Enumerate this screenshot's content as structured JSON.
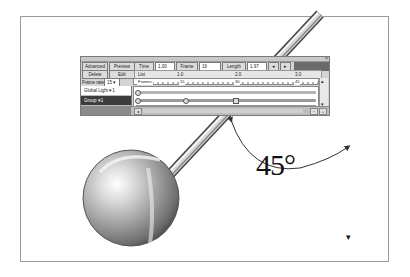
{
  "canvas": {
    "background": "#ffffff",
    "frame_border_color": "#9a9a9a"
  },
  "timeline_window": {
    "close_glyph": "×",
    "buttons_row1": [
      {
        "label": "Advanced"
      },
      {
        "label": "Preview"
      }
    ],
    "buttons_row2": [
      {
        "label": "Delete"
      },
      {
        "label": "Edit"
      }
    ],
    "time_label": "Time",
    "time_value": "1.00",
    "frame_label": "Frame",
    "frame_value": "16",
    "length_label": "Length",
    "length_value": "1.97",
    "nav_prev": "◂",
    "nav_next": "▸",
    "list_label": "List",
    "ruler_top_marks": [
      "1.0",
      "2.0",
      "3.0"
    ],
    "frame_rate_label": "Frame rate",
    "frame_rate_value": "15",
    "ruler_marks": [
      "Frames",
      "15",
      "30",
      "45"
    ],
    "layers": [
      {
        "label": "Global Light ▾1",
        "selected": false
      },
      {
        "label": "Group ▾1",
        "selected": true
      }
    ],
    "scroll_up": "▴",
    "scroll_down": "▾",
    "bottom_left_icon": "◂",
    "bottom_right_icons": [
      "−",
      "+"
    ]
  },
  "annotation": {
    "angle_label": "45°"
  },
  "cursor": {
    "glyph": "▾"
  }
}
